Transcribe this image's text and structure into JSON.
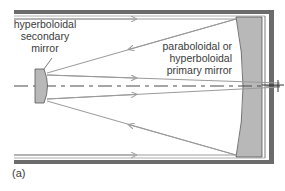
{
  "diagram": {
    "panel_label": "(a)",
    "labels": {
      "secondary_mirror": [
        "hyperboloidal",
        "secondary",
        "mirror"
      ],
      "primary_mirror": [
        "paraboloidal or",
        "hyperboloidal",
        "primary mirror"
      ]
    },
    "colors": {
      "tube": "#6b6b6b",
      "mirror_fill": "#b8b8b8",
      "mirror_stroke": "#555555",
      "ray": "#9a9a9a",
      "axis": "#4a4a4a",
      "text": "#3a3a3a"
    },
    "components": [
      "telescope-tube",
      "primary-mirror",
      "secondary-mirror",
      "optical-axis",
      "incoming-rays",
      "reflected-rays",
      "focal-point"
    ]
  }
}
